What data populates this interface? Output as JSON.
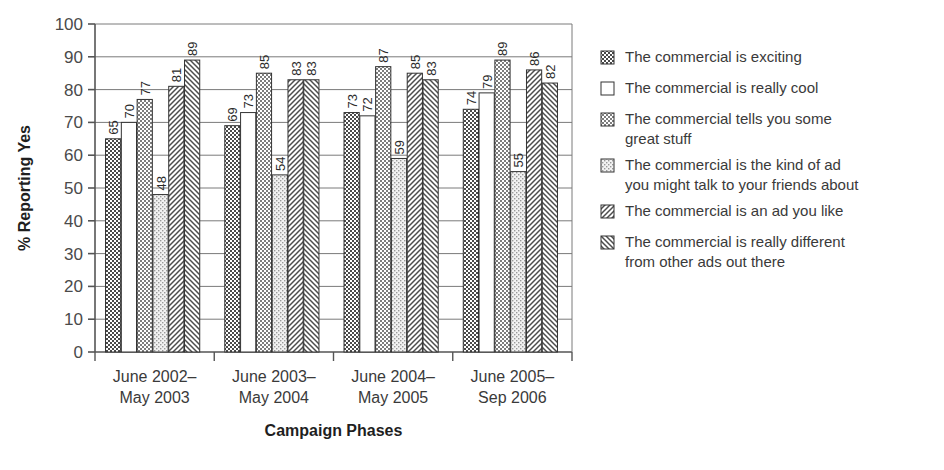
{
  "chart_data": {
    "type": "bar",
    "title": "",
    "xlabel": "Campaign Phases",
    "ylabel": "% Reporting Yes",
    "ylim": [
      0,
      100
    ],
    "ytick_step": 10,
    "yticks": [
      0,
      10,
      20,
      30,
      40,
      50,
      60,
      70,
      80,
      90,
      100
    ],
    "grid": true,
    "legend_position": "right",
    "categories": [
      "June 2002–\nMay 2003",
      "June 2003–\nMay 2004",
      "June 2004–\nMay 2005",
      "June 2005–\nSep 2006"
    ],
    "category_lines": [
      [
        "June 2002–",
        "May 2003"
      ],
      [
        "June 2003–",
        "May 2004"
      ],
      [
        "June 2004–",
        "May 2005"
      ],
      [
        "June 2005–",
        "Sep 2006"
      ]
    ],
    "series": [
      {
        "name": "The commercial is exciting",
        "legend_lines": [
          "The commercial is exciting"
        ],
        "pattern": "dark-checker",
        "values": [
          65,
          69,
          73,
          74
        ]
      },
      {
        "name": "The commercial is really cool",
        "legend_lines": [
          "The commercial is really cool"
        ],
        "pattern": "white",
        "values": [
          70,
          73,
          72,
          79
        ]
      },
      {
        "name": "The commercial tells you some great stuff",
        "legend_lines": [
          "The commercial tells you some",
          "great stuff"
        ],
        "pattern": "mid-checker",
        "values": [
          77,
          85,
          87,
          89
        ]
      },
      {
        "name": "The commercial is the kind of ad you might talk to your friends about",
        "legend_lines": [
          "The commercial is the kind of ad",
          "you might talk to your friends about"
        ],
        "pattern": "light-dots",
        "values": [
          48,
          54,
          59,
          55
        ]
      },
      {
        "name": "The commercial is an ad you like",
        "legend_lines": [
          "The commercial is an ad you like"
        ],
        "pattern": "fwd-hatch",
        "values": [
          81,
          83,
          85,
          86
        ]
      },
      {
        "name": "The commercial is really different from other ads out there",
        "legend_lines": [
          "The commercial is really different",
          "from other ads out there"
        ],
        "pattern": "back-hatch",
        "values": [
          89,
          83,
          83,
          82
        ]
      }
    ]
  },
  "colors": {
    "dark_fill": "#4a4a4a",
    "mid_fill": "#7d7d7d",
    "light_fill": "#dcdcdc",
    "white_fill": "#ffffff",
    "outline": "#333333",
    "grid": "#7a7a7a",
    "text": "#3a3a3a"
  },
  "footer": {
    "cut_text": ""
  }
}
